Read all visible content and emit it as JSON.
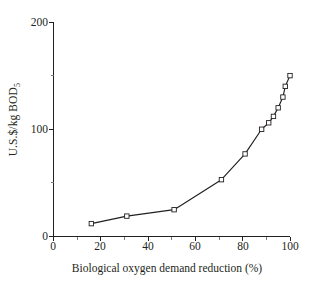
{
  "chart_data": {
    "type": "line",
    "title": "",
    "xlabel": "Biological oxygen demand reduction (%)",
    "ylabel": "U.S.$/kg BOD",
    "ylabel_subscript": "5",
    "xlim": [
      0,
      100
    ],
    "ylim": [
      0,
      200
    ],
    "grid": false,
    "legend": "none",
    "marker": "open-square",
    "line_color": "#231f20",
    "marker_fill": "#ffffff",
    "xticks_major": [
      0,
      20,
      40,
      60,
      80,
      100
    ],
    "xticks_major_labels": [
      "0",
      "20",
      "40",
      "60",
      "80",
      "100"
    ],
    "xticks_minor": [
      10,
      30,
      50,
      70,
      90
    ],
    "yticks_major": [
      0,
      100,
      200
    ],
    "yticks_major_labels": [
      "0",
      "100",
      "200"
    ],
    "yticks_minor": [
      50,
      150
    ],
    "series": [
      {
        "name": "cost curve",
        "x": [
          16,
          31,
          51,
          71,
          81,
          88,
          91,
          93,
          95,
          97,
          98,
          100
        ],
        "y": [
          12,
          19,
          25,
          53,
          77,
          100,
          106,
          112,
          120,
          130,
          140,
          150
        ]
      }
    ]
  }
}
